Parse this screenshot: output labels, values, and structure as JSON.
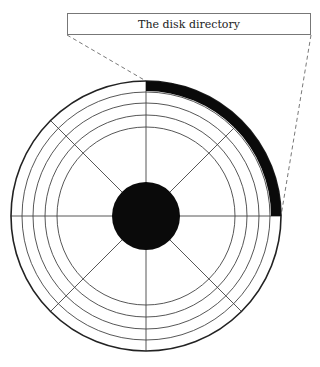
{
  "diagram": {
    "title": "The disk directory",
    "type": "disk-platter",
    "colors": {
      "line": "#444444",
      "fill": "#0a0a0a",
      "background": "#ffffff",
      "callout_border": "#777777"
    },
    "platter": {
      "center": [
        146,
        216
      ],
      "outer_radius": 135,
      "track_radii": [
        135,
        124,
        113,
        101,
        89
      ],
      "hub_radius": 34,
      "sector_count": 8,
      "highlighted_region": {
        "label": "The disk directory",
        "track": "outermost",
        "start_angle_deg": -90,
        "end_angle_deg": 0,
        "outer_radius": 135,
        "inner_radius": 125
      }
    },
    "callout": {
      "box": [
        67,
        13,
        311,
        35
      ],
      "leader_lines": [
        {
          "from": [
            67,
            35
          ],
          "to": [
            146,
            81
          ],
          "style": "dashed"
        },
        {
          "from": [
            311,
            35
          ],
          "to": [
            281,
            216
          ],
          "style": "dashed"
        }
      ]
    }
  }
}
